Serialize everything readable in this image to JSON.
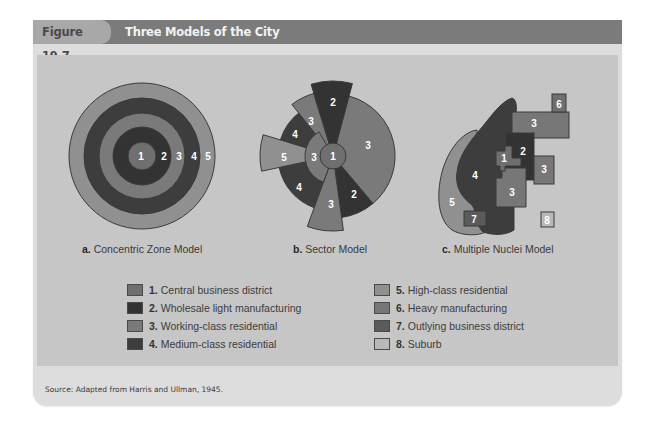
{
  "figure": {
    "label": "Figure 19.7",
    "title": "Three Models of the City",
    "source": "Source: Adapted from Harris and Ullman, 1945."
  },
  "colors": {
    "zone1": "#6f6f6f",
    "zone2": "#333333",
    "zone3": "#7a7a7a",
    "zone4": "#3d3d3d",
    "zone5": "#909090",
    "zone6": "#777777",
    "zone7": "#5b5b5b",
    "zone8": "#b8b8b8",
    "outline": "#3a3a3a",
    "header": "#7b7b7b",
    "panel": "#c6c6c6",
    "outer_panel": "#dddddd"
  },
  "models": [
    {
      "prefix": "a.",
      "name": "Concentric Zone Model",
      "zone_labels": [
        "1",
        "2",
        "3",
        "4",
        "5"
      ]
    },
    {
      "prefix": "b.",
      "name": "Sector Model",
      "zone_labels": [
        "2",
        "3",
        "3",
        "1",
        "3",
        "2",
        "3",
        "4",
        "5",
        "4"
      ]
    },
    {
      "prefix": "c.",
      "name": "Multiple Nuclei Model",
      "zone_labels": [
        "6",
        "3",
        "2",
        "1",
        "3",
        "4",
        "3",
        "5",
        "7",
        "8"
      ]
    }
  ],
  "legend": [
    {
      "num": "1.",
      "label": "Central business district"
    },
    {
      "num": "2.",
      "label": "Wholesale light manufacturing"
    },
    {
      "num": "3.",
      "label": "Working-class residential"
    },
    {
      "num": "4.",
      "label": "Medium-class residential"
    },
    {
      "num": "5.",
      "label": "High-class residential"
    },
    {
      "num": "6.",
      "label": "Heavy manufacturing"
    },
    {
      "num": "7.",
      "label": "Outlying business district"
    },
    {
      "num": "8.",
      "label": "Suburb"
    }
  ]
}
